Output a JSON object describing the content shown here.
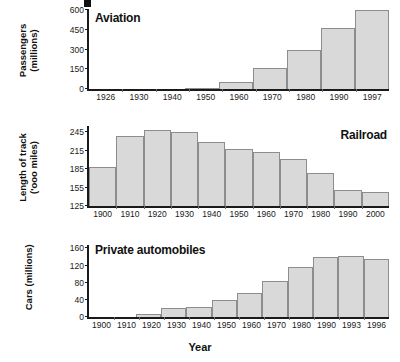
{
  "figure": {
    "xaxis_title": "Year",
    "crop_mark": "black-square-artifact"
  },
  "chart_data": [
    {
      "type": "bar",
      "title": "Aviation",
      "xlabel": "",
      "ylabel": "Passengers (millions)",
      "ylabel_line1": "Passengers",
      "ylabel_line2": "(millions)",
      "categories": [
        "1926",
        "1930",
        "1940",
        "1950",
        "1960",
        "1970",
        "1980",
        "1990",
        "1997"
      ],
      "values": [
        0,
        0,
        0,
        8,
        50,
        160,
        293,
        461,
        600
      ],
      "yticks": [
        "0",
        "150",
        "300",
        "450",
        "600"
      ],
      "ytickvals": [
        0,
        150,
        300,
        450,
        600
      ],
      "ylim": [
        0,
        600
      ],
      "grid": false,
      "legend": "none"
    },
    {
      "type": "bar",
      "title": "Railroad",
      "xlabel": "",
      "ylabel": "Length of track ('ooo miles)",
      "ylabel_line1": "Length of track",
      "ylabel_line2": "('ooo miles)",
      "categories": [
        "1900",
        "1910",
        "1920",
        "1930",
        "1940",
        "1950",
        "1960",
        "1970",
        "1980",
        "1990",
        "2000"
      ],
      "values": [
        189,
        239,
        249,
        245,
        229,
        218,
        213,
        201,
        179,
        151,
        148
      ],
      "yticks": [
        "125",
        "155",
        "185",
        "215",
        "245"
      ],
      "ytickvals": [
        125,
        155,
        185,
        215,
        245
      ],
      "ylim": [
        125,
        255
      ],
      "grid": false,
      "legend": "none"
    },
    {
      "type": "bar",
      "title": "Private automobiles",
      "xlabel": "Year",
      "ylabel": "Cars (millions)",
      "ylabel_line1": "Cars (millions)",
      "ylabel_line2": "",
      "categories": [
        "1900",
        "1910",
        "1920",
        "1930",
        "1940",
        "1950",
        "1960",
        "1970",
        "1980",
        "1990",
        "1993",
        "1996"
      ],
      "values": [
        0,
        0,
        8,
        20,
        24,
        39,
        55,
        84,
        117,
        140,
        142,
        135
      ],
      "yticks": [
        "0",
        "40",
        "80",
        "120",
        "160"
      ],
      "ytickvals": [
        0,
        40,
        80,
        120,
        160
      ],
      "ylim": [
        0,
        168
      ],
      "grid": false,
      "legend": "none"
    }
  ],
  "colors": {
    "bar_fill": "#d9d9d9",
    "bar_stroke": "#8d8d8d",
    "axis": "#1a1a1a",
    "text": "#111111",
    "background": "#ffffff"
  }
}
